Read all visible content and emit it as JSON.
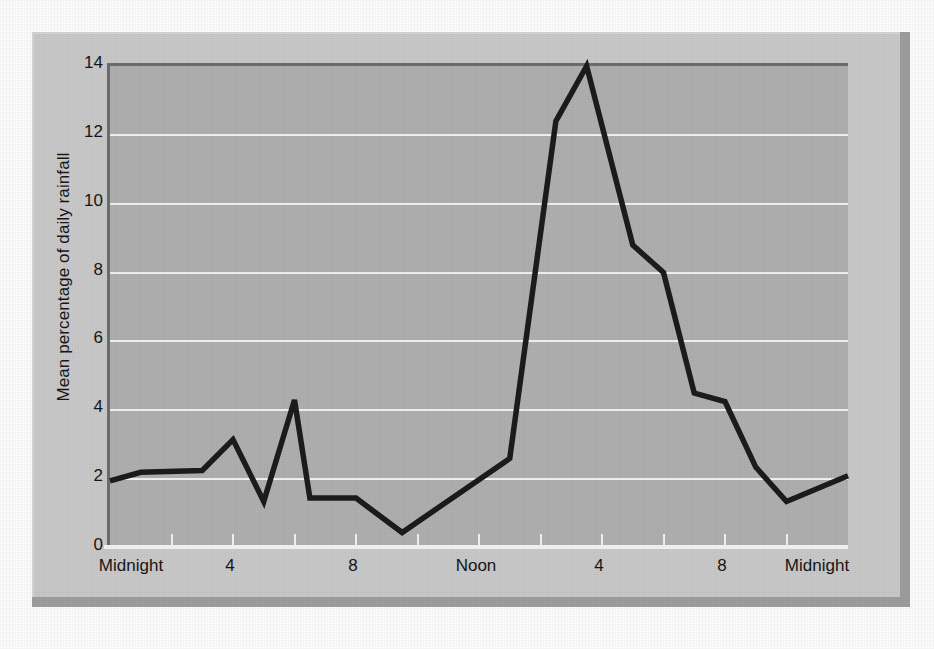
{
  "figure": {
    "kind": "scanned-line-chart",
    "panel_color": "#c9c9c9",
    "plot_color": "#b0b0b0",
    "gridline_color": "#f2f2f2",
    "line_color": "#1c1c1c",
    "shadow_color": "#9e9e9e"
  },
  "chart_data": {
    "type": "line",
    "title": "",
    "subtitle": "",
    "xlabel": "",
    "ylabel": "Mean percentage of daily rainfall",
    "grid": true,
    "legend": false,
    "legend_position": "none",
    "xlim": [
      0,
      24
    ],
    "ylim": [
      0,
      14
    ],
    "yticks": [
      0,
      2,
      4,
      6,
      8,
      10,
      12,
      14
    ],
    "ytick_labels": [
      "0",
      "2",
      "4",
      "6",
      "8",
      "10",
      "12",
      "14"
    ],
    "xticks": [
      0,
      4,
      8,
      12,
      16,
      20,
      24
    ],
    "xtick_labels": [
      "Midnight",
      "4",
      "8",
      "Noon",
      "4",
      "8",
      "Midnight"
    ],
    "xminor_ticks": [
      2,
      4,
      6,
      8,
      10,
      12,
      14,
      16,
      18,
      20,
      22
    ],
    "series": [
      {
        "name": "Mean percentage of daily rainfall",
        "x": [
          0,
          1,
          3,
          4,
          5,
          6,
          6.5,
          8,
          9.5,
          13,
          14.5,
          15.5,
          17,
          18,
          19,
          20,
          21,
          22,
          24
        ],
        "values": [
          1.95,
          2.2,
          2.25,
          3.15,
          1.35,
          4.3,
          1.45,
          1.45,
          0.45,
          2.6,
          12.4,
          14.0,
          8.8,
          8.0,
          4.5,
          4.25,
          2.35,
          1.35,
          2.1
        ]
      }
    ]
  }
}
